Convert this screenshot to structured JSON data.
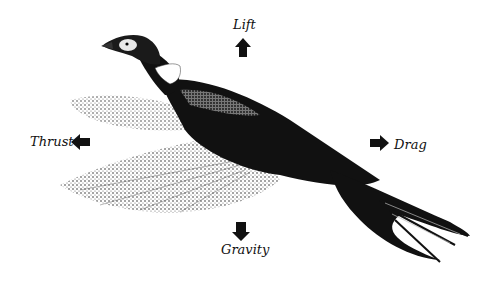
{
  "diagram": {
    "forces": [
      {
        "name": "lift",
        "label": "Lift",
        "direction": "up"
      },
      {
        "name": "thrust",
        "label": "Thrust",
        "direction": "left"
      },
      {
        "name": "drag",
        "label": "Drag",
        "direction": "right"
      },
      {
        "name": "gravity",
        "label": "Gravity",
        "direction": "down"
      }
    ]
  },
  "colors": {
    "ink": "#111111",
    "background": "#ffffff",
    "wing_light": "#9a9a9a",
    "wing_mid": "#555555"
  }
}
